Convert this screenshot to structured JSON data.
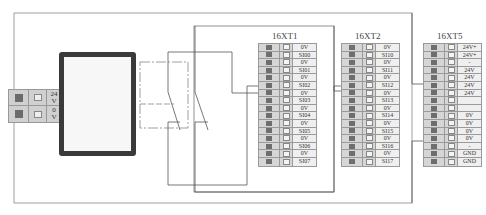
{
  "power_supply": {
    "label": "power-supply-unit",
    "terminals": [
      {
        "top": "24",
        "bottom": "V"
      },
      {
        "top": "0",
        "bottom": "V"
      }
    ]
  },
  "blocks": [
    {
      "id": "16XT1",
      "title": "16XT1",
      "rows": [
        "0V",
        "SI00",
        "0V",
        "SI01",
        "0V",
        "SI02",
        "0V",
        "SI03",
        "0V",
        "SI04",
        "0V",
        "SI05",
        "0V",
        "SI06",
        "0V",
        "SI07"
      ]
    },
    {
      "id": "16XT2",
      "title": "16XT2",
      "rows": [
        "0V",
        "SI10",
        "0V",
        "SI11",
        "0V",
        "SI12",
        "0V",
        "SI13",
        "0V",
        "SI14",
        "0V",
        "SI15",
        "0V",
        "SI16",
        "0V",
        "SI17"
      ]
    },
    {
      "id": "16XT5",
      "title": "16XT5",
      "rows": [
        "24V+",
        "24V+",
        "-",
        "24V",
        "24V",
        "24V",
        "24V",
        "",
        "",
        "0V",
        "0V",
        "0V",
        "0V",
        "-",
        "GND",
        "GND"
      ]
    }
  ],
  "colors": {
    "wire": "#555555",
    "terminal_fill": "#d6d6d6",
    "terminal_dark": "#6e6e6e",
    "psu_border": "#3a3a3a"
  }
}
